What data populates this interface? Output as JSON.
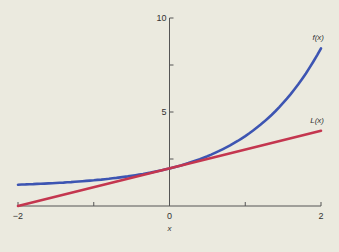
{
  "chart_data": {
    "type": "line",
    "title": "",
    "xlabel": "x",
    "ylabel": "",
    "xlim": [
      -2,
      2
    ],
    "ylim": [
      0,
      10
    ],
    "x_ticks": [
      -2,
      -1,
      0,
      1,
      2
    ],
    "x_tick_labels": [
      "−2",
      "",
      "0",
      "",
      "2"
    ],
    "y_ticks": [
      0,
      2.5,
      5,
      7.5,
      10
    ],
    "y_tick_labels": [
      "",
      "",
      "5",
      "",
      "10"
    ],
    "grid": false,
    "legend": "inline labels at right end of curves",
    "series": [
      {
        "name": "f(x)",
        "color": "#3d55b2",
        "x": [
          -2,
          -1.5,
          -1,
          -0.5,
          0,
          0.5,
          1,
          1.5,
          2
        ],
        "values": [
          1.14,
          1.22,
          1.37,
          1.61,
          2.0,
          2.65,
          3.72,
          5.48,
          8.39
        ]
      },
      {
        "name": "L(x)",
        "color": "#c4364f",
        "x": [
          -2,
          2
        ],
        "values": [
          0,
          4
        ]
      }
    ]
  }
}
